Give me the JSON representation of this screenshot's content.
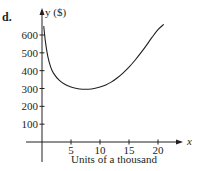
{
  "part_label": "d.",
  "chart_data": {
    "type": "line",
    "title": "",
    "xlabel": "Units of a thousand",
    "ylabel": "y ($)",
    "x_axis_symbol": "x",
    "xticks": [
      "5",
      "10",
      "15",
      "20"
    ],
    "yticks": [
      "100",
      "200",
      "300",
      "400",
      "500",
      "600"
    ],
    "xlim": [
      0,
      23
    ],
    "ylim": [
      0,
      700
    ],
    "grid": false,
    "series": [
      {
        "name": "cost curve",
        "x": [
          0.3,
          0.6,
          1,
          1.5,
          2,
          3,
          4,
          5,
          6,
          7,
          8,
          9,
          10,
          11,
          12,
          13,
          14,
          15,
          16,
          17,
          18,
          19,
          20,
          21
        ],
        "y": [
          650,
          560,
          480,
          420,
          385,
          345,
          322,
          308,
          300,
          296,
          296,
          300,
          308,
          320,
          337,
          360,
          388,
          420,
          457,
          498,
          542,
          588,
          630,
          660
        ]
      }
    ],
    "annotations": [
      "minimum near x ≈ 8, y ≈ 296"
    ]
  },
  "colors": {
    "ink": "#231f20",
    "background": "#ffffff"
  }
}
